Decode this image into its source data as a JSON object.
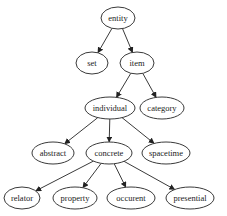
{
  "diagram": {
    "type": "tree",
    "nodes": [
      {
        "id": "entity",
        "label": "entity",
        "cx": 118,
        "cy": 18,
        "rx": 17,
        "ry": 11
      },
      {
        "id": "set",
        "label": "set",
        "cx": 92,
        "cy": 63,
        "rx": 16,
        "ry": 11
      },
      {
        "id": "item",
        "label": "item",
        "cx": 137,
        "cy": 63,
        "rx": 17,
        "ry": 11
      },
      {
        "id": "individual",
        "label": "individual",
        "cx": 110,
        "cy": 108,
        "rx": 25,
        "ry": 11
      },
      {
        "id": "category",
        "label": "category",
        "cx": 162,
        "cy": 108,
        "rx": 22,
        "ry": 11
      },
      {
        "id": "abstract",
        "label": "abstract",
        "cx": 53,
        "cy": 153,
        "rx": 21,
        "ry": 11
      },
      {
        "id": "concrete",
        "label": "concrete",
        "cx": 109,
        "cy": 153,
        "rx": 23,
        "ry": 11
      },
      {
        "id": "spacetime",
        "label": "spacetime",
        "cx": 166,
        "cy": 153,
        "rx": 24,
        "ry": 11
      },
      {
        "id": "relator",
        "label": "relator",
        "cx": 22,
        "cy": 198,
        "rx": 18,
        "ry": 11
      },
      {
        "id": "property",
        "label": "property",
        "cx": 75,
        "cy": 198,
        "rx": 22,
        "ry": 11
      },
      {
        "id": "occurrent",
        "label": "occurent",
        "cx": 131,
        "cy": 198,
        "rx": 24,
        "ry": 11
      },
      {
        "id": "presential",
        "label": "presential",
        "cx": 190,
        "cy": 198,
        "rx": 24,
        "ry": 11
      }
    ],
    "edges": [
      {
        "from": "entity",
        "to": "set"
      },
      {
        "from": "entity",
        "to": "item"
      },
      {
        "from": "item",
        "to": "individual"
      },
      {
        "from": "item",
        "to": "category"
      },
      {
        "from": "individual",
        "to": "abstract"
      },
      {
        "from": "individual",
        "to": "concrete"
      },
      {
        "from": "individual",
        "to": "spacetime"
      },
      {
        "from": "concrete",
        "to": "relator"
      },
      {
        "from": "concrete",
        "to": "property"
      },
      {
        "from": "concrete",
        "to": "occurrent"
      },
      {
        "from": "concrete",
        "to": "presential"
      }
    ]
  }
}
